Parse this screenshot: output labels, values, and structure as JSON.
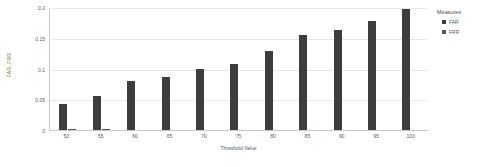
{
  "chart_data": {
    "type": "bar",
    "title": "",
    "subtitle": "",
    "xlabel": "Threshold Value",
    "ylabel": "FAR, FRR",
    "grid": true,
    "legend_position": "right",
    "legend_title": "Measures",
    "categories": [
      "50",
      "55",
      "60",
      "65",
      "70",
      "75",
      "80",
      "85",
      "90",
      "95",
      "100"
    ],
    "ylim": [
      0,
      0.2
    ],
    "yticks": [
      0,
      0.05,
      0.1,
      0.15,
      0.2
    ],
    "ytick_labels": [
      "0",
      "0.05",
      "0.1",
      "0.15",
      "0.2"
    ],
    "series": [
      {
        "name": "FAR",
        "color": "#3d3d3d",
        "values": [
          0.042,
          0.055,
          0.079,
          0.086,
          0.099,
          0.108,
          0.129,
          0.154,
          0.162,
          0.178,
          0.197
        ]
      },
      {
        "name": "FRR",
        "color": "#555555",
        "values": [
          0.002,
          0.001,
          0.0,
          0.0,
          0.0,
          0.0,
          0.0,
          0.0,
          0.0,
          0.0,
          0.0
        ]
      }
    ]
  },
  "axes": {
    "y_title": "FAR, FRR",
    "x_title": "Threshold Value"
  },
  "legend": {
    "title": "Measures",
    "items": [
      {
        "label": "FAR",
        "color": "#3d3d3d"
      },
      {
        "label": "FRR",
        "color": "#555555"
      }
    ]
  }
}
